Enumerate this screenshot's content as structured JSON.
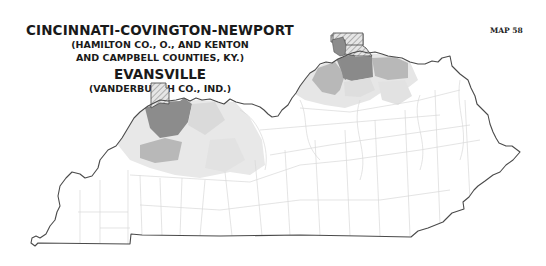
{
  "title": {
    "line1": "CINCINNATI-COVINGTON-NEWPORT",
    "line2": "(HAMILTON CO., O., AND KENTON",
    "line3": "AND CAMPBELL COUNTIES, KY.)",
    "line4": "EVANSVILLE",
    "line5": "(VANDERBURGH CO., IND.)"
  },
  "map_number": "MAP 58",
  "map": {
    "region": "Kentucky",
    "metro_areas": [
      {
        "name": "Cincinnati-Covington-Newport",
        "hatched_county": "Hamilton Co., O.",
        "core_counties": [
          "Kenton",
          "Campbell"
        ]
      },
      {
        "name": "Evansville",
        "hatched_county": "Vanderburgh Co., Ind."
      }
    ],
    "colors": {
      "outline": "#4a4a4a",
      "county_border": "#d6d6d6",
      "shade_dark": "#8c8c8c",
      "shade_medium": "#b4b4b4",
      "shade_light": "#dcdcdc",
      "shade_lightest": "#ececec",
      "background": "#ffffff"
    }
  }
}
